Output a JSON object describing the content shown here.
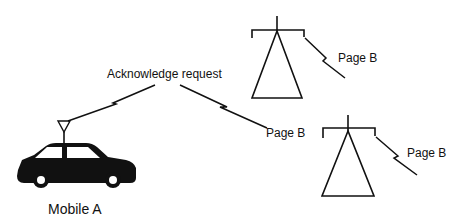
{
  "diagram": {
    "labels": {
      "acknowledge": "Acknowledge request",
      "page_b_center": "Page B",
      "page_b_tower1": "Page B",
      "page_b_tower2": "Page B",
      "mobile": "Mobile A"
    },
    "nodes": [
      {
        "id": "mobile_a",
        "type": "car-with-antenna",
        "label": "Mobile A"
      },
      {
        "id": "tower_1",
        "type": "base-station-tower"
      },
      {
        "id": "tower_2",
        "type": "base-station-tower"
      }
    ],
    "links": [
      {
        "from": "mobile_a",
        "label": "Acknowledge request",
        "type": "radio-bolt"
      },
      {
        "label": "Page B",
        "type": "radio-bolt"
      },
      {
        "from": "tower_1",
        "label": "Page B",
        "type": "radio-bolt"
      },
      {
        "from": "tower_2",
        "label": "Page B",
        "type": "radio-bolt"
      }
    ],
    "colors": {
      "stroke": "#111111",
      "fill": "#111111",
      "background": "#ffffff"
    }
  }
}
